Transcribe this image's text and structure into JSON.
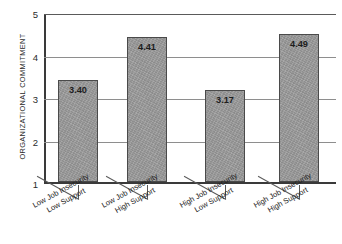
{
  "chart_data": {
    "type": "bar",
    "title": "",
    "xlabel": "",
    "ylabel": "ORGANIZATIONAL COMMITMENT",
    "ylim": [
      1,
      5
    ],
    "yticks": [
      "5",
      "4",
      "3",
      "2",
      "1"
    ],
    "grid": true,
    "legend": false,
    "categories": [
      "Low Job Insecurity Low Support",
      "Low Job Insecurity High Support",
      "High Job Insecurity Low Support",
      "High Job Insecurity High Support"
    ],
    "category_lines": [
      {
        "line1": "Low Job Insecurity",
        "line2": "Low Support"
      },
      {
        "line1": "Low Job Insecurity",
        "line2": "High Support"
      },
      {
        "line1": "High Job Insecurity",
        "line2": "Low Support"
      },
      {
        "line1": "High Job Insecurity",
        "line2": "High Support"
      }
    ],
    "values": [
      3.4,
      4.41,
      3.17,
      4.49
    ],
    "value_labels": [
      "3.40",
      "4.41",
      "3.17",
      "4.49"
    ],
    "bar_color": "#9a9a9a",
    "bar_border_color": "#4a4a4a",
    "grid_color": "#8e8e8e",
    "axis_color": "#3a3a3a",
    "background": "#ffffff"
  }
}
